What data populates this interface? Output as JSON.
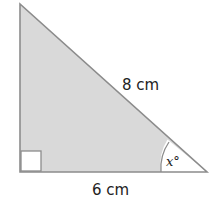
{
  "diagram": {
    "type": "right-triangle",
    "hypotenuse_label": "8 cm",
    "base_label": "6 cm",
    "angle_label": "x°",
    "right_angle_marker": true,
    "colors": {
      "fill": "#d9d9d9",
      "stroke": "#8c8c8c",
      "text": "#222222"
    }
  }
}
